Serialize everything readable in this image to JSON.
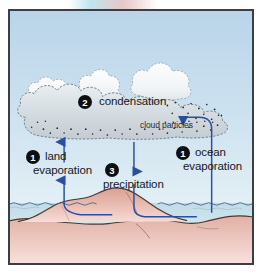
{
  "figure": {
    "background_sky_top": "#bcd6ea",
    "background_sky_bottom": "#dfeef6",
    "ocean_color": "#c8e0e8",
    "land_color": "#d9a79b",
    "land_color_light": "#f0d2cd",
    "arrow_color": "#2a4fa0",
    "frame_color": "#3a3f45"
  },
  "labels": {
    "condensation": "condensation",
    "cloud_particles": "cloud particles",
    "land_evaporation_line1": "land",
    "land_evaporation_line2": "evaporation",
    "ocean_evaporation_line1": "ocean",
    "ocean_evaporation_line2": "evaporation",
    "precipitation": "precipitation"
  },
  "badges": {
    "land_evaporation": "1",
    "condensation": "2",
    "precipitation": "3",
    "ocean_evaporation": "1"
  },
  "arrows": [
    {
      "name": "land-evaporation-arrow",
      "direction": "up",
      "label": "land evaporation"
    },
    {
      "name": "precipitation-arrow",
      "direction": "down",
      "label": "precipitation"
    },
    {
      "name": "ocean-evaporation-arrow",
      "direction": "up-then-left",
      "label": "ocean evaporation"
    }
  ],
  "elements": {
    "clouds_white": "white cumulus clouds",
    "cloud_gray": "gray condensation cloud with particles",
    "mountain": "land mountain",
    "ocean": "ocean water surface"
  }
}
